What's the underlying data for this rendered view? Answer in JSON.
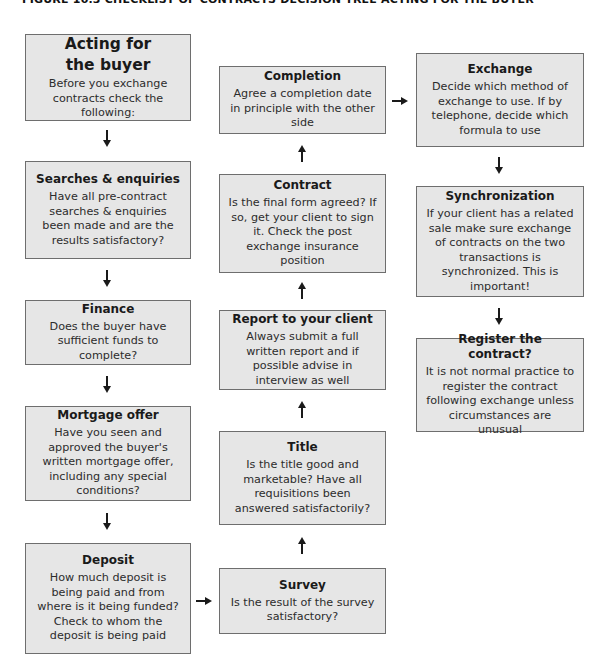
{
  "figure": {
    "title": "FIGURE 10.3 CHECKLIST OF CONTRACTS DECISION TREE ACTING FOR THE BUYER"
  },
  "boxes": {
    "acting": {
      "heading": "Acting for the buyer",
      "text": "Before you exchange contracts check the following:"
    },
    "searches": {
      "heading": "Searches & enquiries",
      "text": "Have all pre-contract searches & enquiries been made and are the results satisfactory?"
    },
    "finance": {
      "heading": "Finance",
      "text": "Does the buyer have sufficient funds to complete?"
    },
    "mortgage": {
      "heading": "Mortgage offer",
      "text": "Have you seen and approved the buyer's written mortgage offer, including any special conditions?"
    },
    "deposit": {
      "heading": "Deposit",
      "text": "How much deposit is being paid and from where is it being funded? Check to whom the deposit is being paid"
    },
    "survey": {
      "heading": "Survey",
      "text": "Is the result of the survey satisfactory?"
    },
    "title": {
      "heading": "Title",
      "text": "Is the title good and marketable? Have all requisitions been answered satisfactorily?"
    },
    "report": {
      "heading": "Report to your client",
      "text": "Always submit a full written report and if possible advise in interview as well"
    },
    "contract": {
      "heading": "Contract",
      "text": "Is the final form agreed? If so, get your client to sign it. Check the post exchange insurance position"
    },
    "completion": {
      "heading": "Completion",
      "text": "Agree a completion date in principle with the other side"
    },
    "exchange": {
      "heading": "Exchange",
      "text": "Decide which method of exchange to use. If by telephone, decide which formula to use"
    },
    "synchronization": {
      "heading": "Synchronization",
      "text": "If your client has a related sale make sure exchange of contracts on the two transactions is synchronized. This is important!"
    },
    "register": {
      "heading": "Register the contract?",
      "text": "It is not normal practice to register the contract following exchange unless circumstances are unusual"
    }
  },
  "colors": {
    "box_fill": "#e6e6e6",
    "box_border": "#6e6e6e",
    "arrow": "#1a1a1a"
  }
}
